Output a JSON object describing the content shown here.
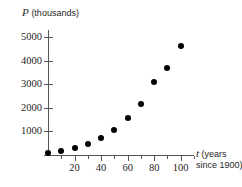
{
  "chart_data": {
    "type": "scatter",
    "title": "",
    "ylabel": "P (thousands)",
    "ylabel_symbol": "P",
    "ylabel_unit": "(thousands)",
    "xlabel": "t (years since 1900)",
    "xlabel_symbol": "t",
    "xlabel_unit_line1": "(years",
    "xlabel_unit_line2": "since 1900)",
    "x": [
      0,
      10,
      20,
      30,
      40,
      50,
      60,
      70,
      80,
      90,
      100
    ],
    "values": [
      100,
      180,
      290,
      460,
      700,
      1050,
      1560,
      2180,
      3100,
      3700,
      4640
    ],
    "series": [
      {
        "name": "Population",
        "values": [
          100,
          180,
          290,
          460,
          700,
          1050,
          1560,
          2180,
          3100,
          3700,
          4640
        ]
      }
    ],
    "xlim": [
      0,
      110
    ],
    "ylim": [
      0,
      5300
    ],
    "ytick_labels": [
      "1000",
      "2000",
      "3000",
      "4000",
      "5000"
    ],
    "ytick_values": [
      1000,
      2000,
      3000,
      4000,
      5000
    ],
    "xtick_labels": [
      "20",
      "40",
      "60",
      "80",
      "100"
    ],
    "xtick_values": [
      20,
      40,
      60,
      80,
      100
    ],
    "xtick_minor_values": [
      10,
      30,
      50,
      70,
      90
    ],
    "grid": false,
    "legend": "none",
    "marker_color": "#000000",
    "axis_color": "#555555"
  }
}
